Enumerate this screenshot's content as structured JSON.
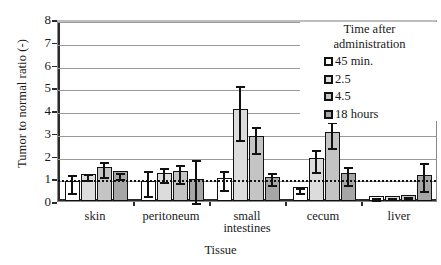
{
  "chart_data": {
    "type": "bar",
    "title": "",
    "xlabel": "Tissue",
    "ylabel": "Tumor to normal ratio (-)",
    "ylim": [
      0,
      8
    ],
    "yticks": [
      0,
      1,
      2,
      3,
      4,
      5,
      6,
      7,
      8
    ],
    "grid": true,
    "legend_position": "top-right",
    "legend_title": "Time after administration",
    "reference_line": {
      "value": 1.05,
      "style": "dotted"
    },
    "categories": [
      "skin",
      "peritoneum",
      "small intestines",
      "cecum",
      "liver"
    ],
    "series": [
      {
        "name": "45 min.",
        "color": "#ffffff",
        "values": [
          0.88,
          0.87,
          1.0,
          0.6,
          0.22
        ],
        "err_low": [
          0.48,
          0.33,
          0.62,
          0.5,
          0.18
        ],
        "err_high": [
          1.28,
          1.45,
          1.45,
          0.72,
          0.26
        ]
      },
      {
        "name": "2.5",
        "color": "#dcdcdc",
        "values": [
          1.18,
          1.25,
          4.05,
          1.9,
          0.24
        ],
        "err_low": [
          1.05,
          0.95,
          2.8,
          1.42,
          0.2
        ],
        "err_high": [
          1.32,
          1.58,
          5.2,
          2.38,
          0.28
        ]
      },
      {
        "name": "4.5",
        "color": "#c4c4c4",
        "values": [
          1.5,
          1.3,
          2.85,
          3.02,
          0.26
        ],
        "err_low": [
          1.18,
          0.92,
          2.22,
          2.45,
          0.22
        ],
        "err_high": [
          1.85,
          1.72,
          3.4,
          3.58,
          0.3
        ]
      },
      {
        "name": "18 hours",
        "color": "#a6a6a6",
        "values": [
          1.3,
          0.95,
          1.05,
          1.25,
          1.15
        ],
        "err_low": [
          1.1,
          0.05,
          0.82,
          0.82,
          0.55
        ],
        "err_high": [
          1.35,
          1.92,
          1.35,
          1.62,
          1.8
        ]
      }
    ]
  },
  "legend": {
    "title_line1": "Time after",
    "title_line2": "administration",
    "items": [
      {
        "label": "45 min.",
        "color": "#ffffff"
      },
      {
        "label": "2.5",
        "color": "#dcdcdc"
      },
      {
        "label": "4.5",
        "color": "#c4c4c4"
      },
      {
        "label": "18 hours",
        "color": "#a6a6a6"
      }
    ]
  },
  "axes": {
    "y_title": "Tumor to normal ratio (-)",
    "x_title": "Tissue",
    "y_tick_labels": [
      "0",
      "1",
      "2",
      "3",
      "4",
      "5",
      "6",
      "7",
      "8"
    ],
    "x_tick_labels": [
      "skin",
      "peritoneum",
      "small\nintestines",
      "cecum",
      "liver"
    ]
  }
}
